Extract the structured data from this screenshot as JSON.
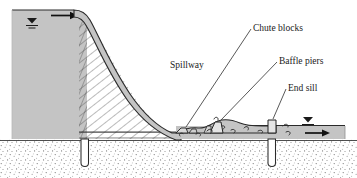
{
  "figure": {
    "type": "engineering-cross-section",
    "width": 357,
    "height": 178
  },
  "labels": {
    "spillway": "Spillway",
    "chute_blocks": "Chute blocks",
    "baffle_piers": "Baffle piers",
    "end_sill": "End sill"
  },
  "symbols": {
    "upstream_water_surface": "water-surface-triangle",
    "downstream_water_surface": "water-surface-triangle",
    "upstream_flow_arrow": "flow-arrow-right",
    "downstream_flow_arrow": "flow-arrow-right"
  },
  "colors": {
    "water_fill": "#c4c4c4",
    "concrete_fill": "#b8b8b8",
    "outline": "#1a1a1a",
    "hatch": "#555555",
    "soil_stipple": "#707070",
    "background": "#ffffff",
    "label_text": "#1a1a1a"
  },
  "components": [
    {
      "name": "reservoir",
      "label": ""
    },
    {
      "name": "ogee-spillway-crest",
      "label": ""
    },
    {
      "name": "spillway-face",
      "label": ""
    },
    {
      "name": "stilling-basin",
      "label": ""
    },
    {
      "name": "chute-blocks",
      "label": "Chute blocks"
    },
    {
      "name": "baffle-piers",
      "label": "Baffle piers"
    },
    {
      "name": "end-sill",
      "label": "End sill"
    },
    {
      "name": "upstream-cutoff-wall",
      "label": ""
    },
    {
      "name": "downstream-cutoff-wall",
      "label": ""
    },
    {
      "name": "foundation-soil",
      "label": ""
    },
    {
      "name": "tailwater-channel",
      "label": ""
    }
  ]
}
